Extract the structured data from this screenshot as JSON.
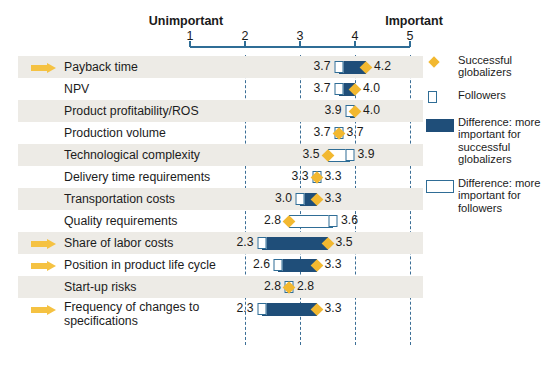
{
  "chart_data": {
    "type": "bar",
    "title": "",
    "xlabel": "",
    "ylabel": "",
    "axis": {
      "left_cap": "Unimportant",
      "right_cap": "Important",
      "ticks": [
        1,
        2,
        3,
        4,
        5
      ],
      "tick_labels": [
        "1",
        "2",
        "3",
        "4",
        "5"
      ],
      "xlim": [
        1,
        5
      ],
      "gridlines_at": [
        2,
        3,
        4,
        5
      ],
      "grid": true
    },
    "categories": [
      "Payback time",
      "NPV",
      "Product profitability/ROS",
      "Production volume",
      "Technological complexity",
      "Delivery time requirements",
      "Transportation costs",
      "Quality requirements",
      "Share of labor costs",
      "Position in product life cycle",
      "Start-up risks",
      "Frequency of changes to specifications"
    ],
    "series": [
      {
        "name": "Followers",
        "values": [
          3.7,
          3.7,
          3.9,
          3.7,
          3.9,
          3.3,
          3.0,
          3.6,
          2.3,
          2.6,
          2.8,
          2.3
        ]
      },
      {
        "name": "Successful globalizers",
        "values": [
          4.2,
          4.0,
          4.0,
          3.7,
          3.5,
          3.3,
          3.3,
          2.8,
          3.5,
          3.3,
          2.8,
          3.3
        ]
      }
    ],
    "legend_position": "right",
    "rows": [
      {
        "label": "Payback time",
        "followers": 3.7,
        "globalizers": 4.2,
        "left_value": "3.7",
        "right_value": "4.2",
        "bar_from": 3.7,
        "bar_to": 4.2,
        "bar_type": "dark",
        "arrow": true,
        "striped": true,
        "two_line": false
      },
      {
        "label": "NPV",
        "followers": 3.7,
        "globalizers": 4.0,
        "left_value": "3.7",
        "right_value": "4.0",
        "bar_from": 3.7,
        "bar_to": 4.0,
        "bar_type": "dark",
        "arrow": false,
        "striped": false,
        "two_line": false
      },
      {
        "label": "Product profitability/ROS",
        "followers": 3.9,
        "globalizers": 4.0,
        "left_value": "3.9",
        "right_value": "4.0",
        "bar_from": 3.9,
        "bar_to": 4.0,
        "bar_type": "dark",
        "arrow": false,
        "striped": true,
        "two_line": false
      },
      {
        "label": "Production volume",
        "followers": 3.7,
        "globalizers": 3.7,
        "left_value": "3.7",
        "right_value": "3.7",
        "bar_from": null,
        "bar_to": null,
        "bar_type": "none",
        "arrow": false,
        "striped": false,
        "two_line": false
      },
      {
        "label": "Technological complexity",
        "followers": 3.9,
        "globalizers": 3.5,
        "left_value": "3.5",
        "right_value": "3.9",
        "bar_from": 3.5,
        "bar_to": 3.9,
        "bar_type": "light",
        "arrow": false,
        "striped": true,
        "two_line": false
      },
      {
        "label": "Delivery time requirements",
        "followers": 3.3,
        "globalizers": 3.3,
        "left_value": "3.3",
        "right_value": "3.3",
        "bar_from": null,
        "bar_to": null,
        "bar_type": "none",
        "arrow": false,
        "striped": false,
        "two_line": false
      },
      {
        "label": "Transportation costs",
        "followers": 3.0,
        "globalizers": 3.3,
        "left_value": "3.0",
        "right_value": "3.3",
        "bar_from": 3.0,
        "bar_to": 3.3,
        "bar_type": "dark",
        "arrow": false,
        "striped": true,
        "two_line": false
      },
      {
        "label": "Quality requirements",
        "followers": 3.6,
        "globalizers": 2.8,
        "left_value": "2.8",
        "right_value": "3.6",
        "bar_from": 2.8,
        "bar_to": 3.6,
        "bar_type": "light",
        "arrow": false,
        "striped": false,
        "two_line": false
      },
      {
        "label": "Share of labor costs",
        "followers": 2.3,
        "globalizers": 3.5,
        "left_value": "2.3",
        "right_value": "3.5",
        "bar_from": 2.3,
        "bar_to": 3.5,
        "bar_type": "dark",
        "arrow": true,
        "striped": true,
        "two_line": false
      },
      {
        "label": "Position in product life cycle",
        "followers": 2.6,
        "globalizers": 3.3,
        "left_value": "2.6",
        "right_value": "3.3",
        "bar_from": 2.6,
        "bar_to": 3.3,
        "bar_type": "dark",
        "arrow": true,
        "striped": false,
        "two_line": false
      },
      {
        "label": "Start-up risks",
        "followers": 2.8,
        "globalizers": 2.8,
        "left_value": "2.8",
        "right_value": "2.8",
        "bar_from": null,
        "bar_to": null,
        "bar_type": "none",
        "arrow": false,
        "striped": true,
        "two_line": false
      },
      {
        "label": "Frequency of changes to specifications",
        "followers": 2.3,
        "globalizers": 3.3,
        "left_value": "2.3",
        "right_value": "3.3",
        "bar_from": 2.3,
        "bar_to": 3.3,
        "bar_type": "dark",
        "arrow": true,
        "striped": false,
        "two_line": true
      }
    ]
  },
  "legend": {
    "items": [
      {
        "marker": "diamond",
        "label": "Successful globalizers"
      },
      {
        "marker": "square",
        "label": "Followers"
      },
      {
        "marker": "bar-dark",
        "label": "Difference: more important for successful globalizers"
      },
      {
        "marker": "bar-light",
        "label": "Difference: more important for followers"
      }
    ]
  },
  "colors": {
    "dark_blue": "#1f4e79",
    "mid_blue": "#2f6d96",
    "gold": "#f2b830",
    "arrow_gold": "#f5c242",
    "stripe": "#edebe6"
  }
}
